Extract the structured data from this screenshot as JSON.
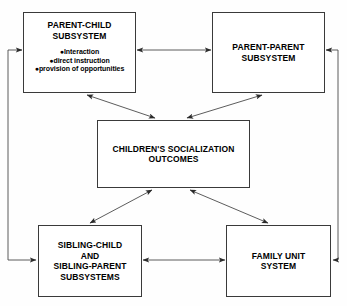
{
  "diagram": {
    "stroke_color": "#3a3a3a",
    "fill_color": "#ffffff",
    "text_color": "#000000",
    "nodes": {
      "parent_child": {
        "title": "PARENT-CHILD\nSUBSYSTEM",
        "bullets": [
          "Interaction",
          "direct instruction",
          "provision of opportunities"
        ],
        "bullet_marker": "●"
      },
      "parent_parent": {
        "title": "PARENT-PARENT\nSUBSYSTEM"
      },
      "center": {
        "title": "CHILDREN'S SOCIALIZATION\nOUTCOMES"
      },
      "sibling": {
        "title": "SIBLING-CHILD\nAND\nSIBLING-PARENT\nSUBSYSTEMS"
      },
      "family_unit": {
        "title": "FAMILY UNIT\nSYSTEM"
      }
    },
    "edges": [
      {
        "name": "parent-child-to-parent-parent",
        "style": "double-arrow"
      },
      {
        "name": "sibling-to-family-unit",
        "style": "double-arrow"
      },
      {
        "name": "parent-child-to-center",
        "style": "double-arrow"
      },
      {
        "name": "parent-parent-to-center",
        "style": "double-arrow"
      },
      {
        "name": "center-to-sibling",
        "style": "double-arrow"
      },
      {
        "name": "center-to-family-unit",
        "style": "double-arrow"
      },
      {
        "name": "left-loop-parent-child-sibling",
        "style": "double-arrow-elbow"
      },
      {
        "name": "right-loop-parent-parent-family-unit",
        "style": "double-arrow-elbow"
      }
    ]
  }
}
